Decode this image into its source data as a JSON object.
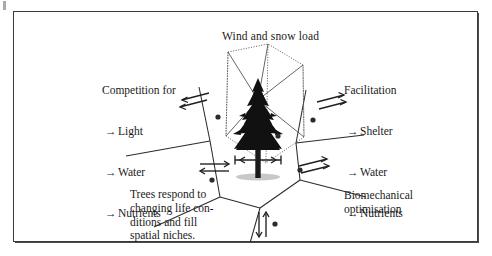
{
  "figure": {
    "title": "Wind and snow load",
    "left_block": {
      "heading": "Competition for",
      "items": [
        {
          "arrow": "→",
          "label": "Light"
        },
        {
          "arrow": "→",
          "label": "Water"
        },
        {
          "arrow": "→",
          "label": "Nutrients"
        }
      ]
    },
    "right_block": {
      "heading": "Facilitation",
      "items": [
        {
          "arrow": "→",
          "label": "Shelter"
        },
        {
          "arrow": "→",
          "label": "Water"
        },
        {
          "arrow": "→",
          "label": "Nutrients"
        }
      ]
    },
    "bottom_left_text": "Trees respond to\nchanging life con-\nditions and fill\nspatial niches.",
    "bottom_right_text": "Biomechanical\noptimisation",
    "colors": {
      "frame": "#3a3a3a",
      "text": "#1a1a1a",
      "tree": "#111111",
      "cell_lines": "#2b2b2b",
      "crown_envelope": "#555555",
      "background": "#ffffff"
    },
    "icons": {
      "upper_left_exchange": "double-diagonal-arrow-icon",
      "upper_right_exchange": "double-diagonal-arrow-icon",
      "mid_left_exchange": "double-horizontal-arrow-icon",
      "mid_right_exchange": "double-diagonal-arrow-icon",
      "bottom_exchange": "double-vertical-arrow-icon",
      "trunk_span": "horizontal-double-headed-arrow-icon",
      "tree": "conifer-tree-icon",
      "crown_envelope": "dotted-polyhedron-icon",
      "cells": "voronoi-cell-lines-icon",
      "neighbour_dots": "neighbour-dot-icon"
    }
  }
}
